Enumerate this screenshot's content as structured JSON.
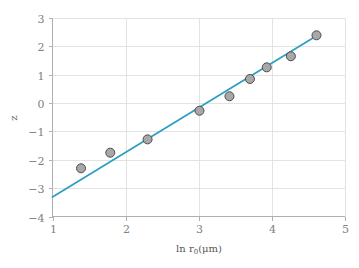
{
  "chart_data": {
    "type": "scatter",
    "title": "",
    "xlabel": "ln r₀ (μm)",
    "xlabel_parts": {
      "prefix": "ln r",
      "subscript": "0",
      "suffix": "(μm)"
    },
    "ylabel": "z",
    "xlim": [
      1,
      5
    ],
    "ylim": [
      -4,
      3
    ],
    "xticks": [
      1,
      2,
      3,
      4,
      5
    ],
    "xtick_labels": [
      "1",
      "2",
      "3",
      "4",
      "5"
    ],
    "yticks": [
      3,
      2,
      1,
      0,
      -1,
      -2,
      -3,
      -4
    ],
    "ytick_labels": [
      "3",
      "2",
      "1",
      "0",
      "−1",
      "−2",
      "−3",
      "−4"
    ],
    "grid": true,
    "legend": "none",
    "series": [
      {
        "name": "data",
        "type": "scatter",
        "marker": "circle",
        "marker_size": 9,
        "marker_facecolor": "#a8a8a8",
        "marker_edgecolor": "#4d4d4d",
        "points": [
          {
            "x": 1.39,
            "y": -2.3
          },
          {
            "x": 1.79,
            "y": -1.75
          },
          {
            "x": 2.3,
            "y": -1.28
          },
          {
            "x": 3.01,
            "y": -0.27
          },
          {
            "x": 3.42,
            "y": 0.24
          },
          {
            "x": 3.7,
            "y": 0.85
          },
          {
            "x": 3.93,
            "y": 1.26
          },
          {
            "x": 4.26,
            "y": 1.65
          },
          {
            "x": 4.61,
            "y": 2.39
          }
        ]
      },
      {
        "name": "fit-line",
        "type": "line",
        "color": "#2f9fc4",
        "linewidth": 1.8,
        "points": [
          {
            "x": 1.0,
            "y": -3.31
          },
          {
            "x": 4.64,
            "y": 2.42
          }
        ]
      }
    ]
  },
  "colors": {
    "background": "#ffffff",
    "grid": "#e3e3e3",
    "axis": "#b0b0b0",
    "tick_text": "#808080",
    "axis_title": "#595959",
    "line": "#2f9fc4",
    "marker_fill": "#a8a8a8",
    "marker_edge": "#4d4d4d"
  }
}
